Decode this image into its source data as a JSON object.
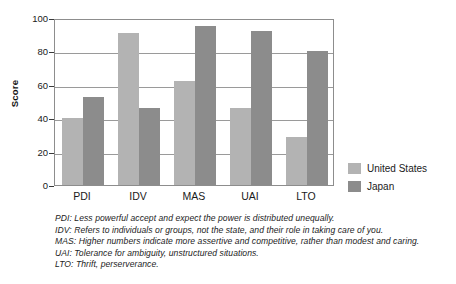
{
  "chart_data": {
    "type": "bar",
    "title": "",
    "xlabel": "",
    "ylabel": "Score",
    "ylim": [
      0,
      100
    ],
    "ytick_values": [
      0,
      20,
      40,
      60,
      80,
      100
    ],
    "ytick_labels": [
      "0",
      "20",
      "40",
      "60",
      "80",
      "100"
    ],
    "grid": true,
    "legend_position": "right",
    "categories": [
      "PDI",
      "IDV",
      "MAS",
      "UAI",
      "LTO"
    ],
    "series": [
      {
        "name": "United States",
        "color": "#b3b3b3",
        "values": [
          40,
          91,
          62,
          46,
          29
        ]
      },
      {
        "name": "Japan",
        "color": "#8c8c8c",
        "values": [
          53,
          46,
          95,
          92,
          80
        ]
      }
    ]
  },
  "legend": {
    "items": [
      {
        "label": "United States",
        "swatch": "us"
      },
      {
        "label": "Japan",
        "swatch": "jp"
      }
    ]
  },
  "footnotes": [
    "PDI: Less powerful accept and expect the power is distributed unequally.",
    "IDV: Refers to individuals or groups, not the state, and their role in taking care of you.",
    "MAS: Higher numbers indicate more assertive and competitive, rather than modest and caring.",
    "UAI: Tolerance for ambiguity, unstructured situations.",
    "LTO: Thrift, perserverance."
  ],
  "colors": {
    "united_states": "#b3b3b3",
    "japan": "#8c8c8c",
    "axis": "#8d8d8d",
    "gridline": "#9a9a9a",
    "text": "#1a1a1a",
    "background": "#ffffff"
  }
}
